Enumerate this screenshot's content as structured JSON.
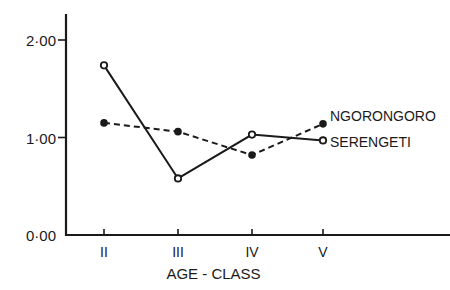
{
  "chart_data": {
    "type": "line",
    "title": "",
    "xlabel": "AGE - CLASS",
    "ylabel": "",
    "categories": [
      "II",
      "III",
      "IV",
      "V"
    ],
    "yticks": [
      {
        "value": 0,
        "label": "0·00"
      },
      {
        "value": 1,
        "label": "1·00"
      },
      {
        "value": 2,
        "label": "2·00"
      }
    ],
    "ylim": [
      0,
      2.2
    ],
    "grid": false,
    "legend_position": "inline-right",
    "series": [
      {
        "name": "NGORONGORO",
        "style": "dashed",
        "marker": "filled-circle",
        "values": [
          1.15,
          1.06,
          0.82,
          1.14
        ]
      },
      {
        "name": "SERENGETI",
        "style": "solid",
        "marker": "open-circle",
        "values": [
          1.74,
          0.58,
          1.03,
          0.97
        ]
      }
    ]
  }
}
